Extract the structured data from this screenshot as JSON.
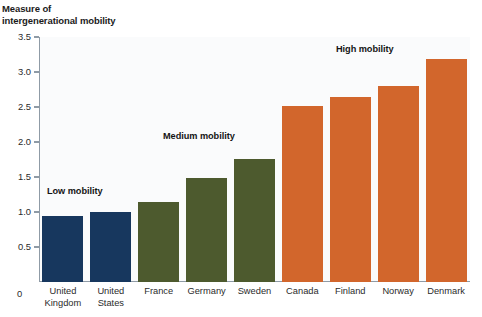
{
  "chart_data": {
    "type": "bar",
    "title": "Measure of intergenerational mobility",
    "title_lines": [
      "Measure of",
      "intergenerational mobility"
    ],
    "xlabel": "",
    "ylabel": "Measure of intergenerational mobility",
    "ylim": [
      0,
      3.5
    ],
    "ytick_step": 0.5,
    "ytick_labels": [
      "3.5",
      "3.0",
      "2.5",
      "2.0",
      "1.5",
      "1.0",
      "0.5"
    ],
    "ytick_values": [
      3.5,
      3.0,
      2.5,
      2.0,
      1.5,
      1.0,
      0.5
    ],
    "baseline_label": "0",
    "grid": false,
    "legend_position": "none",
    "categories": [
      "United Kingdom",
      "United States",
      "France",
      "Germany",
      "Sweden",
      "Canada",
      "Finland",
      "Norway",
      "Denmark"
    ],
    "category_label_lines": [
      [
        "United",
        "Kingdom"
      ],
      [
        "United",
        "States"
      ],
      [
        "France"
      ],
      [
        "Germany"
      ],
      [
        "Sweden"
      ],
      [
        "Canada"
      ],
      [
        "Finland"
      ],
      [
        "Norway"
      ],
      [
        "Denmark"
      ]
    ],
    "values": [
      0.94,
      1.0,
      1.15,
      1.48,
      1.76,
      2.51,
      2.65,
      2.8,
      3.19
    ],
    "bar_colors": [
      "#17375e",
      "#17375e",
      "#4d5a2e",
      "#4d5a2e",
      "#4d5a2e",
      "#d2662c",
      "#d2662c",
      "#d2662c",
      "#d2662c"
    ],
    "groups": [
      {
        "label": "Low mobility",
        "color": "#17375e",
        "categories": [
          "United Kingdom",
          "United States"
        ]
      },
      {
        "label": "Medium mobility",
        "color": "#4d5a2e",
        "categories": [
          "France",
          "Germany",
          "Sweden"
        ]
      },
      {
        "label": "High mobility",
        "color": "#d2662c",
        "categories": [
          "Canada",
          "Finland",
          "Norway",
          "Denmark"
        ]
      }
    ],
    "annotations": [
      {
        "text": "Low mobility",
        "x_px": 47,
        "y_px": 186
      },
      {
        "text": "Medium mobility",
        "x_px": 163,
        "y_px": 131
      },
      {
        "text": "High mobility",
        "x_px": 336,
        "y_px": 44
      }
    ],
    "colors": {
      "low_mobility": "#17375e",
      "medium_mobility": "#4d5a2e",
      "high_mobility": "#d2662c",
      "axis": "#8f9ba6",
      "plot_background": "#fafbfc",
      "text": "#1b1b1b"
    }
  }
}
